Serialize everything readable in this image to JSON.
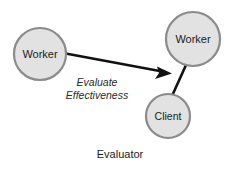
{
  "diagram": {
    "caption": "Evaluator",
    "background_color": "#ffffff",
    "node_fill_color": "#e2e2e2",
    "node_stroke_color": "#8b8b8b",
    "edge_color": "#111111",
    "nodes": [
      {
        "id": "worker-left",
        "label": "Worker",
        "cx": 40,
        "cy": 54,
        "r": 26
      },
      {
        "id": "worker-right",
        "label": "Worker",
        "cx": 193,
        "cy": 39,
        "r": 27
      },
      {
        "id": "client",
        "label": "Client",
        "cx": 168,
        "cy": 116,
        "r": 22
      }
    ],
    "edges": [
      {
        "id": "evaluate-effectiveness-arrow",
        "from": "worker-left",
        "to": "worker-right",
        "arrow": true,
        "label_line1": "Evaluate",
        "label_line2": "Effectiveness"
      },
      {
        "id": "worker-client-link",
        "from": "worker-right",
        "to": "client",
        "arrow": false,
        "label_line1": "",
        "label_line2": ""
      }
    ]
  }
}
